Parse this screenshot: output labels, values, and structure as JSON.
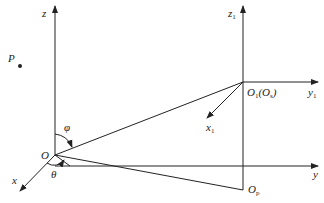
{
  "diagram": {
    "type": "coordinate-frames",
    "labels": {
      "z": "z",
      "P": "P",
      "phi": "φ",
      "O": "O",
      "x": "x",
      "theta": "θ",
      "z1_main": "z",
      "z1_sub": "1",
      "O1_main": "O",
      "O1_sub": "1",
      "O1_paren_open": "(O",
      "O1_paren_sub": "s",
      "O1_paren_close": ")",
      "y1_main": "y",
      "y1_sub": "1",
      "x1_main": "x",
      "x1_sub": "1",
      "y": "y",
      "Op_main": "O",
      "Op_sub": "p"
    },
    "points": {
      "O": [
        55,
        155
      ],
      "O1": [
        243,
        82
      ],
      "Op": [
        243,
        190
      ],
      "P": [
        20,
        66
      ]
    },
    "color": "#222222"
  }
}
